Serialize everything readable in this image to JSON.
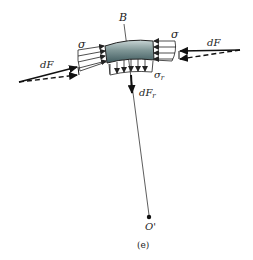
{
  "figure": {
    "caption": "(e)",
    "labels": {
      "point_B": "B",
      "center_O": "O'",
      "sigma_left": "σ",
      "sigma_right": "σ",
      "sigma_r": "σ",
      "sigma_r_sub": "r",
      "dF_left": "dF",
      "dF_right": "dF",
      "dF_r": "dF",
      "dF_r_sub": "r"
    },
    "colors": {
      "block_dark": "#3f5a5e",
      "block_light": "#c9d6d6",
      "line": "#222222",
      "background": "#ffffff"
    }
  }
}
